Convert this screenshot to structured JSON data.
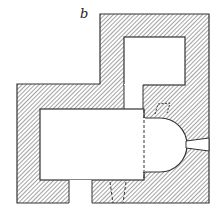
{
  "figure": {
    "label": "b",
    "type": "architectural floor plan",
    "colors": {
      "wall_line": "#333333",
      "hatch": "#555555",
      "background": "#ffffff"
    }
  }
}
